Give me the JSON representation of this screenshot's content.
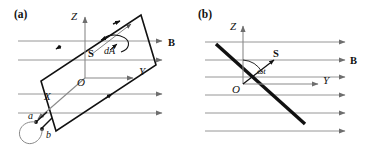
{
  "figure": {
    "width": 366,
    "height": 150,
    "background": "#ffffff",
    "ink": "#111111",
    "field_line_color": "#8a8a8a",
    "axis_color": "#8a8a8a",
    "coil_color": "#111111"
  },
  "panel_a": {
    "label": "(a)",
    "axes": {
      "z": "Z",
      "y": "Y",
      "x": "X",
      "origin": "O"
    },
    "field_label": "B",
    "normal_vector_label": "S",
    "area_element_label": "dA",
    "terminals": [
      "a",
      "b"
    ],
    "field_lines": 4,
    "coil_rotation_deg": -38
  },
  "panel_b": {
    "label": "(b)",
    "axes": {
      "z": "Z",
      "y": "Y",
      "origin": "O"
    },
    "field_label": "B",
    "normal_vector_label": "S",
    "angle_label": "ωt",
    "field_lines": 6,
    "coil_rotation_deg": 38
  }
}
